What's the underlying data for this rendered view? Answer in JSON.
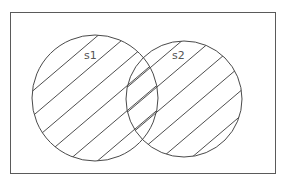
{
  "diagram": {
    "type": "venn",
    "sets": [
      {
        "id": "s1",
        "label": "s1",
        "shaded": true,
        "hatch": "diagonal"
      },
      {
        "id": "s2",
        "label": "s2",
        "shaded": true,
        "hatch": "diagonal"
      }
    ],
    "intersection": {
      "sets": [
        "s1",
        "s2"
      ],
      "shaded": true
    },
    "universe": {
      "bordered": true,
      "shaded": false
    }
  },
  "colors": {
    "background": "#ffffff",
    "stroke": "#4a4a4a",
    "label": "#555555"
  }
}
